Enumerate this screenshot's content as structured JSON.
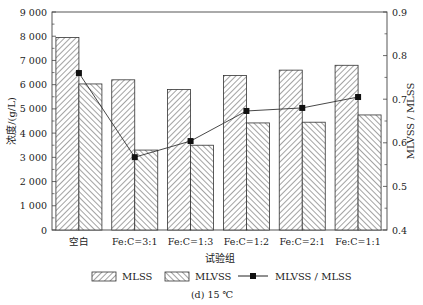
{
  "chart_data": {
    "type": "bar",
    "title": "",
    "caption": "(d) 15 ℃",
    "xlabel": "试验组",
    "ylabel": "浓度/(g/L)",
    "y2label": "MLVSS / MLSS",
    "categories": [
      "空白",
      "Fe:C=3:1",
      "Fe:C=1:3",
      "Fe:C=1:2",
      "Fe:C=2:1",
      "Fe:C=1:1"
    ],
    "ylim": [
      0,
      9000
    ],
    "yticks": [
      0,
      1000,
      2000,
      3000,
      4000,
      5000,
      6000,
      7000,
      8000,
      9000
    ],
    "ytick_labels": [
      "0",
      "1 000",
      "2 000",
      "3 000",
      "4 000",
      "5 000",
      "6 000",
      "7 000",
      "8 000",
      "9 000"
    ],
    "y2lim": [
      0.4,
      0.9
    ],
    "y2ticks": [
      0.4,
      0.5,
      0.6,
      0.7,
      0.8,
      0.9
    ],
    "y2tick_labels": [
      "0.4",
      "0.5",
      "0.6",
      "0.7",
      "0.8",
      "0.9"
    ],
    "grid": false,
    "legend_position": "bottom",
    "series": [
      {
        "name": "MLSS",
        "type": "bar",
        "axis": "left",
        "pattern": "hatch-forward",
        "values": [
          7950,
          6200,
          5800,
          6380,
          6600,
          6800
        ]
      },
      {
        "name": "MLVSS",
        "type": "bar",
        "axis": "left",
        "pattern": "hatch-backward",
        "values": [
          6030,
          3300,
          3500,
          4420,
          4450,
          4750
        ]
      },
      {
        "name": "MLVSS / MLSS",
        "type": "line",
        "axis": "right",
        "marker": "square",
        "values": [
          0.76,
          0.567,
          0.604,
          0.673,
          0.68,
          0.705
        ]
      }
    ]
  },
  "legend": {
    "items": [
      {
        "label": "MLSS",
        "icon": "hatch-forward-swatch"
      },
      {
        "label": "MLVSS",
        "icon": "hatch-backward-swatch"
      },
      {
        "label": "MLVSS / MLSS",
        "icon": "line-square-marker"
      }
    ]
  }
}
